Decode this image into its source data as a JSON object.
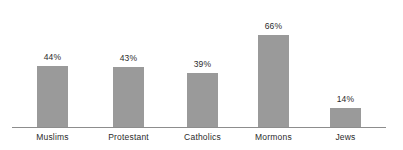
{
  "chart_data": {
    "type": "bar",
    "title": "",
    "xlabel": "",
    "ylabel": "",
    "ylim": [
      0,
      75
    ],
    "grid": false,
    "legend": "none",
    "categories": [
      "Muslims",
      "Protestant",
      "Catholics",
      "Mormons",
      "Jews"
    ],
    "values": [
      44,
      43,
      39,
      66,
      14
    ],
    "value_labels": [
      "44%",
      "43%",
      "39%",
      "66%",
      "14%"
    ],
    "bar_color": "#9a9a9a",
    "axis_color": "#8d8d8d",
    "text_color": "#2b2b2b",
    "background": "#ffffff"
  },
  "bars": [
    {
      "label": "Muslims",
      "value_label": "44%",
      "value": 44
    },
    {
      "label": "Protestant",
      "value_label": "43%",
      "value": 43
    },
    {
      "label": "Catholics",
      "value_label": "39%",
      "value": 39
    },
    {
      "label": "Mormons",
      "value_label": "66%",
      "value": 66
    },
    {
      "label": "Jews",
      "value_label": "14%",
      "value": 14
    }
  ]
}
